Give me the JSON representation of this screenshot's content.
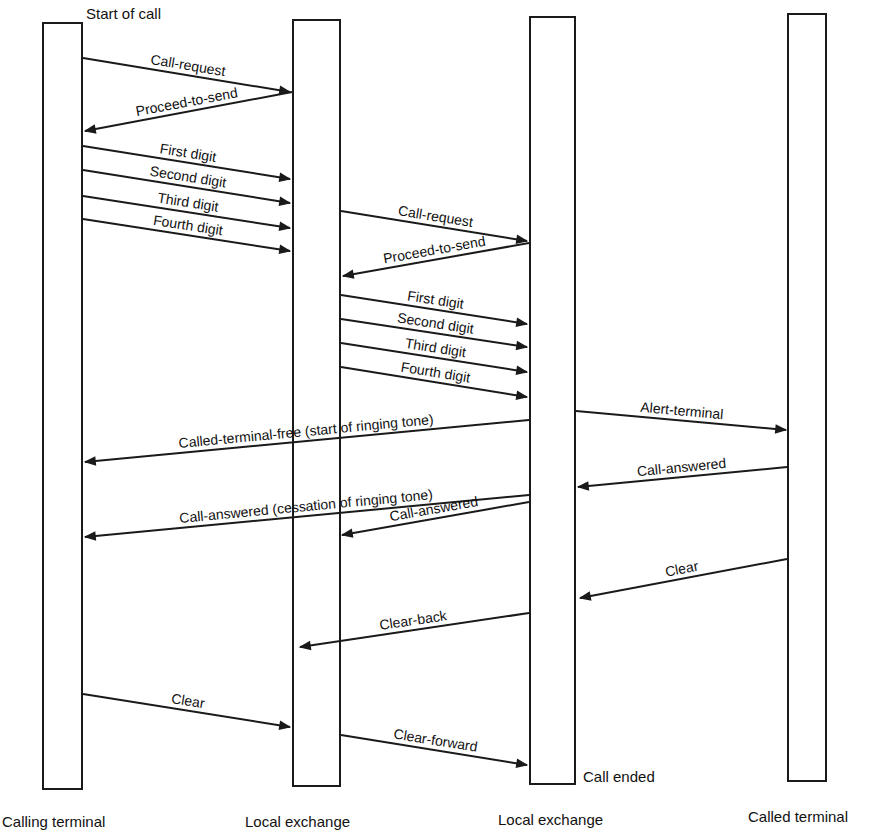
{
  "diagram": {
    "type": "sequence",
    "annotations": {
      "start": "Start of call",
      "end": "Call ended"
    },
    "lifelines": [
      {
        "id": "calling",
        "label": "Calling terminal",
        "box": {
          "x": 43,
          "y": 23,
          "w": 39,
          "h": 766
        },
        "label_x": 2,
        "label_y": 827
      },
      {
        "id": "lex_a",
        "label": "Local exchange",
        "box": {
          "x": 293,
          "y": 20,
          "w": 47,
          "h": 766
        },
        "label_x": 245,
        "label_y": 827
      },
      {
        "id": "lex_b",
        "label": "Local exchange",
        "box": {
          "x": 530,
          "y": 17,
          "w": 45,
          "h": 767
        },
        "label_x": 498,
        "label_y": 825
      },
      {
        "id": "called",
        "label": "Called terminal",
        "box": {
          "x": 788,
          "y": 14,
          "w": 38,
          "h": 767
        },
        "label_x": 748,
        "label_y": 822
      }
    ],
    "messages": [
      {
        "label": "Call-request",
        "from": "calling",
        "to": "lex_a",
        "x1": 83,
        "y1": 58,
        "x2": 290,
        "y2": 92
      },
      {
        "label": "Proceed-to-send",
        "from": "lex_a",
        "to": "calling",
        "x1": 292,
        "y1": 92,
        "x2": 85,
        "y2": 131
      },
      {
        "label": "First digit",
        "from": "calling",
        "to": "lex_a",
        "x1": 83,
        "y1": 146,
        "x2": 290,
        "y2": 179
      },
      {
        "label": "Second digit",
        "from": "calling",
        "to": "lex_a",
        "x1": 83,
        "y1": 170,
        "x2": 290,
        "y2": 203
      },
      {
        "label": "Third digit",
        "from": "calling",
        "to": "lex_a",
        "x1": 83,
        "y1": 196,
        "x2": 290,
        "y2": 228
      },
      {
        "label": "Fourth digit",
        "from": "calling",
        "to": "lex_a",
        "x1": 83,
        "y1": 219,
        "x2": 290,
        "y2": 251
      },
      {
        "label": "Call-request",
        "from": "lex_a",
        "to": "lex_b",
        "x1": 341,
        "y1": 211,
        "x2": 527,
        "y2": 241
      },
      {
        "label": "Proceed-to-send",
        "from": "lex_b",
        "to": "lex_a",
        "x1": 529,
        "y1": 243,
        "x2": 343,
        "y2": 276
      },
      {
        "label": "First digit",
        "from": "lex_a",
        "to": "lex_b",
        "x1": 341,
        "y1": 295,
        "x2": 527,
        "y2": 324
      },
      {
        "label": "Second digit",
        "from": "lex_a",
        "to": "lex_b",
        "x1": 341,
        "y1": 319,
        "x2": 527,
        "y2": 347
      },
      {
        "label": "Third digit",
        "from": "lex_a",
        "to": "lex_b",
        "x1": 341,
        "y1": 343,
        "x2": 527,
        "y2": 372
      },
      {
        "label": "Fourth digit",
        "from": "lex_a",
        "to": "lex_b",
        "x1": 341,
        "y1": 367,
        "x2": 527,
        "y2": 397
      },
      {
        "label": "Alert-terminal",
        "from": "lex_b",
        "to": "called",
        "x1": 576,
        "y1": 411,
        "x2": 786,
        "y2": 430
      },
      {
        "label": "Called-terminal-free  (start of ringing tone)",
        "from": "lex_b",
        "to": "calling",
        "x1": 529,
        "y1": 420,
        "x2": 85,
        "y2": 462
      },
      {
        "label": "Call-answered",
        "from": "called",
        "to": "lex_b",
        "x1": 787,
        "y1": 467,
        "x2": 578,
        "y2": 487
      },
      {
        "label": "Call-answered (cessation of ringing tone)",
        "from": "lex_b",
        "to": "calling",
        "x1": 529,
        "y1": 495,
        "x2": 85,
        "y2": 537
      },
      {
        "label": "Call-answered",
        "from": "lex_b",
        "to": "lex_a",
        "x1": 529,
        "y1": 502,
        "x2": 342,
        "y2": 535
      },
      {
        "label": "Clear",
        "from": "called",
        "to": "lex_b",
        "x1": 787,
        "y1": 559,
        "x2": 580,
        "y2": 598
      },
      {
        "label": "Clear-back",
        "from": "lex_b",
        "to": "lex_a",
        "x1": 529,
        "y1": 613,
        "x2": 300,
        "y2": 647
      },
      {
        "label": "Clear",
        "from": "calling",
        "to": "lex_a",
        "x1": 83,
        "y1": 694,
        "x2": 290,
        "y2": 727
      },
      {
        "label": "Clear-forward",
        "from": "lex_a",
        "to": "lex_b",
        "x1": 341,
        "y1": 735,
        "x2": 527,
        "y2": 765
      }
    ]
  }
}
